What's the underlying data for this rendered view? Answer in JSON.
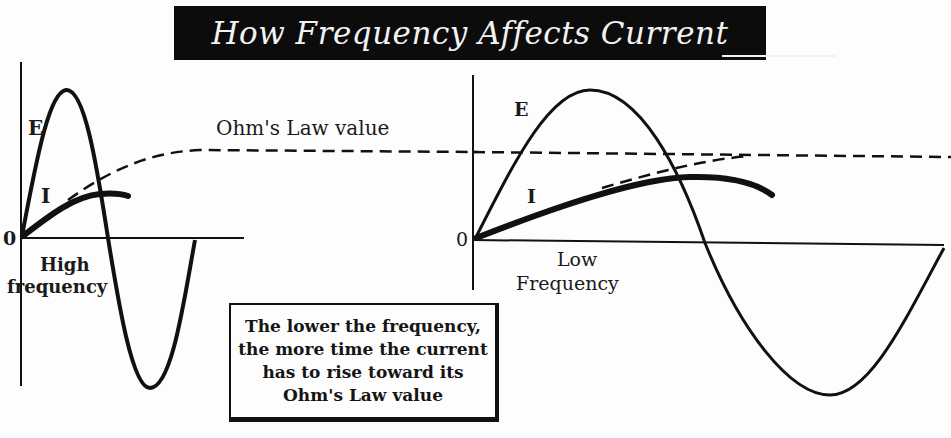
{
  "title": "How Frequency Affects Current",
  "labels": {
    "ohms_law_value": "Ohm's Law value",
    "left_E": "E",
    "left_I": "I",
    "left_zero": "0",
    "left_caption_1": "High",
    "left_caption_2": "frequency",
    "right_E": "E",
    "right_I": "I",
    "right_zero": "0",
    "right_caption_1": "Low",
    "right_caption_2": "Frequency"
  },
  "note": {
    "lines": [
      "The lower the frequency,",
      "the more time the current",
      "has to rise toward  its",
      "Ohm's Law value"
    ]
  },
  "colors": {
    "ink": "#111111",
    "banner": "#0c0c0c",
    "banner_text": "#f2f2f2",
    "paper": "#fdfdfd"
  },
  "panels": [
    {
      "name": "high-frequency",
      "curves": [
        "E (voltage sine wave, one cycle, short period)",
        "I (current, rises briefly, stays well below Ohm's Law value)",
        "Ohm's Law value (dashed asymptote)"
      ]
    },
    {
      "name": "low-frequency",
      "curves": [
        "E (voltage sine wave, one cycle, long period)",
        "I (current, rises closer toward Ohm's Law value)",
        "Ohm's Law value (dashed asymptote)"
      ]
    }
  ]
}
